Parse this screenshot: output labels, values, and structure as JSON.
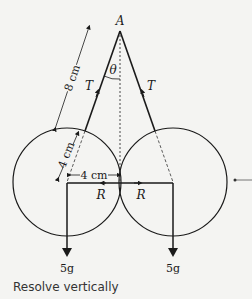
{
  "diagram": {
    "apex_label": "A",
    "angle_label": "θ",
    "tension_left": "T",
    "tension_right": "T",
    "string_length": "8 cm",
    "radius_label": "4 cm",
    "center_distance_label": "4 cm",
    "reaction_left": "R",
    "reaction_right": "R",
    "weight_left": "5g",
    "weight_right": "5g"
  },
  "caption": "Resolve vertically"
}
